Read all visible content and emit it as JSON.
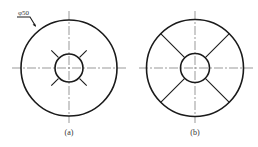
{
  "figures": [
    {
      "id": "a",
      "caption": "(a)",
      "center": [
        69,
        68
      ],
      "outer_radius": 48,
      "inner_radius": 14,
      "radial_marks": "short 45-degree ticks from r=15 to r=25",
      "dimension": {
        "label": "φ50",
        "target": "outer circle diameter"
      }
    },
    {
      "id": "b",
      "caption": "(b)",
      "center": [
        195,
        68
      ],
      "outer_radius": 48,
      "inner_radius": 14,
      "radial_marks": "full 45-degree spokes from inner circle to outer circle"
    }
  ],
  "colors": {
    "line": "#1a1a1a",
    "centerline": "#555555",
    "background": "#ffffff"
  }
}
